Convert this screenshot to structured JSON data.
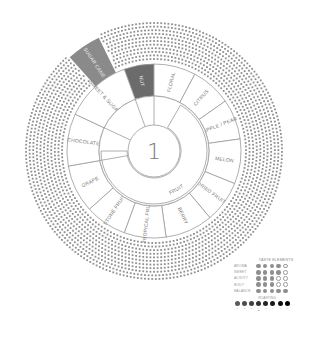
{
  "wheel": {
    "center_label": "1",
    "center": [
      154,
      151
    ],
    "radii": {
      "center": 26,
      "inner_outer": 55,
      "outer": 87,
      "dots_inner": 90,
      "dots_outer": 130
    },
    "colors": {
      "dark": "#6b6b6b",
      "mid": "#8a8a8a",
      "line": "#9a9a9a",
      "dots": "#8f8f8f",
      "text": "#777777"
    },
    "inner_segments": [
      {
        "label": "FRUIT",
        "start": 30,
        "end": 270
      }
    ],
    "outer_segments": [
      {
        "label": "NUT",
        "start": 340,
        "end": 360,
        "style": "dark"
      },
      {
        "label": "FLORAL",
        "start": 0,
        "end": 28,
        "style": "light"
      },
      {
        "label": "CITRUS",
        "start": 28,
        "end": 55,
        "style": "light"
      },
      {
        "label": "APPLE / PEAR",
        "start": 55,
        "end": 82,
        "style": "light"
      },
      {
        "label": "MELON",
        "start": 82,
        "end": 112,
        "style": "light"
      },
      {
        "label": "DRIED FRUIT",
        "start": 112,
        "end": 140,
        "style": "light"
      },
      {
        "label": "BERRY",
        "start": 140,
        "end": 172,
        "style": "light"
      },
      {
        "label": "TROPICAL FRUIT",
        "start": 172,
        "end": 200,
        "style": "light"
      },
      {
        "label": "STONE FRUIT",
        "start": 200,
        "end": 228,
        "style": "light"
      },
      {
        "label": "GRAPE",
        "start": 228,
        "end": 260,
        "style": "light"
      },
      {
        "label": "CHOCOLATE",
        "start": 260,
        "end": 295,
        "style": "light"
      },
      {
        "label": "SWEET & SUGARY",
        "start": 295,
        "end": 340,
        "style": "light"
      }
    ],
    "highlight": {
      "label": "SUGAR CANE",
      "start": 318,
      "end": 334,
      "r_in": 87,
      "r_out": 126
    }
  },
  "legend": {
    "title": "TASTE ELEMENTS",
    "rows": [
      {
        "label": "AROMA",
        "value": 4,
        "max": 5
      },
      {
        "label": "SWEET",
        "value": 4,
        "max": 5
      },
      {
        "label": "ACIDITY",
        "value": 3,
        "max": 5
      },
      {
        "label": "BODY",
        "value": 3,
        "max": 5
      },
      {
        "label": "BALANCE",
        "value": 5,
        "max": 5
      }
    ],
    "roasting": {
      "title": "ROASTING",
      "steps": [
        "1",
        "2",
        "3",
        "4",
        "5",
        "6",
        "7",
        "8"
      ],
      "colors": [
        "#5a5a5a",
        "#4d4d4d",
        "#404040",
        "#333333",
        "#262626",
        "#1a1a1a",
        "#101010",
        "#000000"
      ],
      "selected_index": 3
    }
  }
}
